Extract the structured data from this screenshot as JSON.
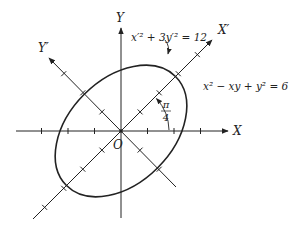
{
  "figure": {
    "type": "diagram",
    "colors": {
      "ink": "#222222",
      "background": "#ffffff"
    }
  },
  "axes": {
    "x_label": "X",
    "y_label": "Y",
    "x_prime_label": "X′",
    "y_prime_label": "Y′",
    "origin_label": "O",
    "ticks_per_side_xy": 3,
    "ticks_per_side_rotated": 4
  },
  "rotation": {
    "angle_label_numerator": "π",
    "angle_label_denominator": "4",
    "angle_rad": 0.7853981634
  },
  "curve": {
    "original_equation": "x² − xy + y² = 6",
    "rotated_equation": "x′² + 3y′² = 12",
    "semi_axis_x_prime": 3.4641,
    "semi_axis_y_prime": 2.0
  }
}
